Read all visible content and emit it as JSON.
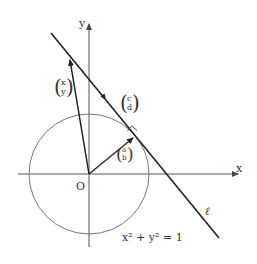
{
  "diagram": {
    "axes": {
      "x_label": "x",
      "y_label": "y",
      "origin_label": "O"
    },
    "circle": {
      "equation": "x² + y² = 1",
      "center": [
        89,
        174
      ],
      "radius": 60
    },
    "line": {
      "label": "ℓ",
      "from": [
        51,
        33
      ],
      "to": [
        219,
        238
      ]
    },
    "vectors": [
      {
        "name": "position-xy",
        "top": "x",
        "bottom": "y",
        "tip": [
          69,
          57
        ]
      },
      {
        "name": "normal-ab",
        "top": "a",
        "bottom": "b",
        "tip": [
          135,
          136
        ]
      },
      {
        "name": "direction-cd",
        "top": "c",
        "bottom": "d"
      }
    ],
    "colors": {
      "line": "#222222",
      "axis": "#555555",
      "circle": "#777777",
      "text": "#333333"
    }
  }
}
